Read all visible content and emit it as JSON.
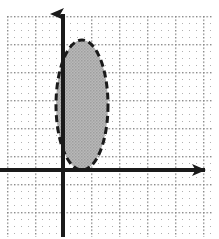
{
  "figure": {
    "title": "",
    "width": 219,
    "height": 239,
    "background_color": "#ffffff"
  },
  "chart_data": {
    "type": "scatter",
    "title": "",
    "subtitle": "",
    "xlabel": "",
    "ylabel": "",
    "grid": {
      "visible": true,
      "style": "dotted",
      "minor_spacing_px": 7,
      "major_spacing_px": 28,
      "dot_color": "#b0b0b0",
      "major_dot_color": "#8a8a8a",
      "left_px": 7,
      "top_px": 16,
      "right_px": 212,
      "bottom_px": 237
    },
    "axes": {
      "origin_px": {
        "x": 63,
        "y": 170
      },
      "unit_px": 28,
      "axis_color": "#1a1a1a",
      "axis_width_px": 4,
      "arrowheads": [
        "x-positive",
        "y-positive"
      ],
      "x_axis": {
        "start_px": 0,
        "end_px": 217,
        "y_px": 170,
        "tick_labels": []
      },
      "y_axis": {
        "start_px": 237,
        "end_px": 2,
        "x_px": 63,
        "tick_labels": []
      },
      "xlim_units": [
        -2.25,
        5.5
      ],
      "ylim_units": [
        -2.4,
        6.0
      ]
    },
    "series": [
      {
        "name": "shaded-ellipse-region",
        "type": "ellipse",
        "center_px": {
          "x": 82,
          "y": 105
        },
        "center_units": {
          "x": 0.68,
          "y": 2.32
        },
        "radius_x_px": 26,
        "radius_y_px": 65,
        "radius_x_units": 0.93,
        "radius_y_units": 2.32,
        "fill_color": "#b9b9b9",
        "fill_pattern": "stipple",
        "border_color": "#1a1a1a",
        "border_style": "dashed",
        "border_width_px": 3,
        "border_dash": "7 4",
        "tangent_to": "x-axis"
      }
    ],
    "legend": {
      "visible": false,
      "position": "none",
      "entries": []
    },
    "annotations": []
  }
}
